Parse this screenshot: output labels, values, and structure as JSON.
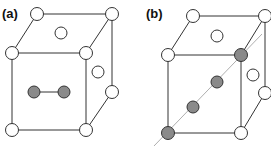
{
  "figure": {
    "panels": [
      {
        "label": "(a)",
        "description": "Cubic unit cell with face-centred lattice sites and a split dumbbell interstitial pair"
      },
      {
        "label": "(b)",
        "description": "Cubic unit cell with shaded atoms aligned along a body diagonal direction"
      }
    ],
    "colors": {
      "open_atom_fill": "#ffffff",
      "shaded_atom_fill": "#8a8a8a",
      "edge": "#333333",
      "diagonal_line": "#999999"
    }
  }
}
